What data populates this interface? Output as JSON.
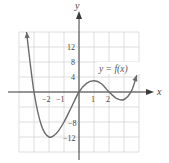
{
  "chart_data": {
    "type": "line",
    "title": "",
    "xlabel": "x",
    "ylabel": "y",
    "xlim": [
      -4,
      4
    ],
    "ylim": [
      -16,
      16
    ],
    "grid": true,
    "x_grid_step": 1,
    "y_grid_step": 4,
    "x_tick_labels": [
      "-2",
      "-1",
      "1",
      "2"
    ],
    "x_tick_values": [
      -2,
      -1,
      1,
      2
    ],
    "y_tick_labels": [
      "12",
      "8",
      "4",
      "-8",
      "-12"
    ],
    "y_tick_values": [
      12,
      8,
      4,
      -8,
      -12
    ],
    "series": [
      {
        "name": "y = f(x)",
        "x": [
          -3.5,
          -3,
          -2.5,
          -2,
          -1.5,
          -1,
          -0.5,
          0,
          0.5,
          1,
          1.5,
          2,
          2.5,
          3,
          3.5,
          3.85
        ],
        "values": [
          16,
          0,
          -9,
          -12,
          -11,
          -8,
          -4,
          0,
          2.3,
          3,
          2.2,
          0,
          -1.7,
          -2,
          0.3,
          4.5
        ]
      }
    ],
    "annotations": [
      {
        "text": "y = f(x)",
        "x": 1.5,
        "y": 6
      }
    ],
    "color": "#6a6a6a"
  },
  "labels": {
    "x_axis": "x",
    "y_axis": "y",
    "function": "y = f(x)",
    "ticks": {
      "xm2": "−2",
      "xm1": "−1",
      "x1": "1",
      "x2": "2",
      "y12": "12",
      "y8": "8",
      "y4": "4",
      "ym8": "−8",
      "ym12": "−12"
    }
  }
}
